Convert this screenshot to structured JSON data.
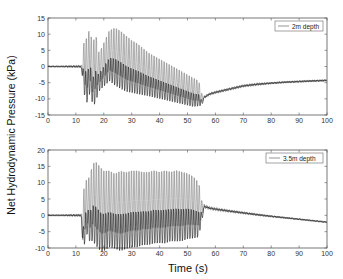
{
  "figure": {
    "ylabel": "Net Hydrodynamic Pressure (kPa)",
    "xlabel": "Time (s)"
  },
  "chart_data": [
    {
      "type": "line",
      "title": "",
      "legend": [
        "2m depth"
      ],
      "legend_position": "upper right",
      "xlabel": "",
      "ylabel": "Net Hydrodynamic Pressure (kPa)",
      "xlim": [
        0,
        100
      ],
      "ylim": [
        -15,
        15
      ],
      "xticks": [
        0,
        10,
        20,
        30,
        40,
        50,
        60,
        70,
        80,
        90,
        100
      ],
      "yticks": [
        -15,
        -10,
        -5,
        0,
        5,
        10,
        15
      ],
      "grid": false,
      "series": [
        {
          "name": "2m depth",
          "description": "Oscillating pressure signal: flat near 0 until ~12s, strong oscillations 12-55s peaking ~13 kPa near 23s, then recovery from ~-11 kPa at 55s rising to ~-4 kPa at 100s",
          "envelope": {
            "t": [
              0,
              12,
              13,
              14,
              15,
              16,
              17,
              18,
              19,
              20,
              22,
              24,
              26,
              28,
              30,
              32,
              34,
              36,
              38,
              40,
              42,
              44,
              46,
              48,
              50,
              52,
              54,
              55,
              56,
              58,
              60,
              65,
              70,
              75,
              80,
              85,
              90,
              95,
              100
            ],
            "max": [
              0,
              0.5,
              9,
              10,
              13,
              7,
              12,
              5,
              6,
              8,
              12,
              13,
              12,
              10.5,
              9,
              8,
              6.5,
              5,
              4,
              3,
              2,
              1,
              0,
              -1,
              -2,
              -3,
              -4,
              -8,
              -9,
              -8,
              -7.5,
              -6.5,
              -5.5,
              -5,
              -4.8,
              -4.5,
              -4.3,
              -4.1,
              -4
            ],
            "min": [
              0,
              -0.5,
              -6,
              -8,
              -5,
              -9,
              -8,
              -6,
              -5,
              -4,
              -2,
              -3,
              -4,
              -5,
              -5.5,
              -6,
              -6.5,
              -7,
              -7.5,
              -8,
              -8.5,
              -9,
              -9.5,
              -10,
              -10.5,
              -11,
              -11,
              -11.5,
              -10,
              -9,
              -8.5,
              -7.5,
              -6.5,
              -6,
              -5.5,
              -5.2,
              -5,
              -4.8,
              -4.6
            ]
          }
        }
      ]
    },
    {
      "type": "line",
      "title": "",
      "legend": [
        "3.5m depth"
      ],
      "legend_position": "upper right",
      "xlabel": "Time (s)",
      "ylabel": "Net Hydrodynamic Pressure (kPa)",
      "xlim": [
        0,
        100
      ],
      "ylim": [
        -10,
        20
      ],
      "xticks": [
        0,
        10,
        20,
        30,
        40,
        50,
        60,
        70,
        80,
        90,
        100
      ],
      "yticks": [
        -10,
        -5,
        0,
        5,
        10,
        15,
        20
      ],
      "grid": false,
      "series": [
        {
          "name": "3.5m depth",
          "description": "Flat near 0 until ~12s, spike to ~-9 at 12.5s, strong oscillations 13-55s peaking ~18 kPa near 17s with sustained ~15 kPa crests, troughs ~-7, then decay from ~3 kPa at 56s to ~-2 kPa at 100s",
          "envelope": {
            "t": [
              0,
              12,
              12.5,
              13,
              14,
              15,
              16,
              17,
              18,
              19,
              20,
              22,
              24,
              26,
              28,
              30,
              32,
              34,
              36,
              38,
              40,
              42,
              44,
              46,
              48,
              50,
              52,
              54,
              55,
              56,
              58,
              60,
              65,
              70,
              75,
              80,
              85,
              90,
              95,
              100
            ],
            "max": [
              0,
              0.5,
              2,
              11,
              12,
              13,
              17,
              18,
              17,
              16,
              15,
              15,
              14,
              15,
              14.5,
              15,
              15,
              14.5,
              14.5,
              15,
              14.5,
              15,
              14.5,
              15,
              14.5,
              14,
              13,
              11,
              5,
              3.5,
              2.8,
              2.5,
              1.8,
              1.2,
              0.6,
              0,
              -0.5,
              -1,
              -1.5,
              -2
            ],
            "min": [
              0,
              -0.5,
              -9,
              -6,
              -3,
              -5,
              -4,
              -5,
              -6,
              -7,
              -7,
              -6,
              -6.5,
              -7,
              -6.5,
              -6,
              -6,
              -5.5,
              -5.5,
              -5,
              -5,
              -5,
              -4.5,
              -4.5,
              -4.5,
              -4,
              -4,
              -4,
              -1,
              2,
              1.6,
              1.3,
              0.8,
              0.3,
              -0.2,
              -0.6,
              -1,
              -1.4,
              -1.8,
              -2.2
            ]
          }
        }
      ]
    }
  ],
  "colors": {
    "trace_dark": "#1a1a1a",
    "trace_gray": "#7a7a7a",
    "axes": "#555555",
    "text": "#222222"
  }
}
